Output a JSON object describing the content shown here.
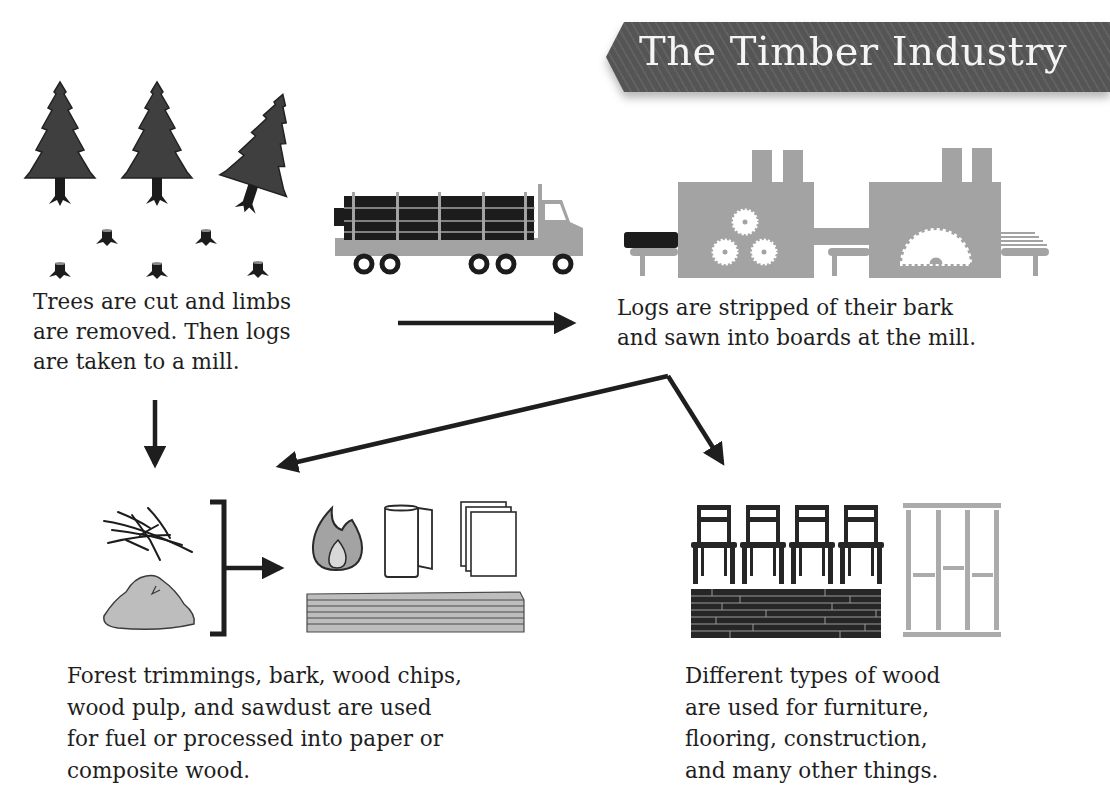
{
  "title": "The Timber Industry",
  "steps": [
    {
      "id": "harvest",
      "illustration": "trees-and-stumps",
      "lines": [
        "Trees are cut and limbs",
        "are removed. Then logs",
        "are taken to a mill."
      ]
    },
    {
      "id": "mill",
      "illustration": "sawmill",
      "lines": [
        "Logs are stripped of their bark",
        "and sawn into boards at the mill."
      ]
    },
    {
      "id": "byproducts",
      "illustration": "trimmings-sawdust-to-fuel-paper-composite",
      "lines": [
        "Forest trimmings, bark, wood chips,",
        "wood pulp, and sawdust are used",
        "for fuel or processed into paper or",
        "composite wood."
      ]
    },
    {
      "id": "lumber-uses",
      "illustration": "chairs-flooring-framing",
      "lines": [
        "Different types of wood",
        "are used for furniture,",
        "flooring, construction,",
        "and many other things."
      ]
    }
  ],
  "icons": {
    "trees": "pine-tree-icon",
    "stumps": "tree-stump-icon",
    "truck": "log-truck-icon",
    "mill": "sawmill-icon",
    "branches": "branches-icon",
    "sawdust": "sawdust-pile-icon",
    "fire": "fire-icon",
    "paper_towel": "paper-towel-roll-icon",
    "paper": "paper-sheets-icon",
    "composite": "composite-board-icon",
    "chairs": "chair-icon",
    "flooring": "flooring-icon",
    "framing": "wall-framing-icon"
  },
  "colors": {
    "dark": "#262626",
    "tree": "#3f3f3f",
    "mid_gray": "#a3a3a3",
    "light_gray": "#bdbdbd",
    "banner": "#555555",
    "banner_text": "#f5f5f5"
  }
}
